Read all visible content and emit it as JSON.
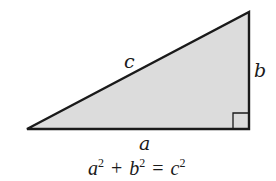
{
  "diagram": {
    "colors": {
      "fill": "#dcdcdc",
      "stroke": "#1a1a1a",
      "background": "#ffffff"
    },
    "vertices": {
      "left": [
        27,
        129
      ],
      "right_bottom": [
        249,
        129
      ],
      "right_top": [
        249,
        12
      ]
    },
    "right_angle_marker": {
      "x": 233,
      "y": 113,
      "size": 16
    },
    "labels": {
      "hypotenuse": "c",
      "vertical_leg": "b",
      "horizontal_leg": "a"
    },
    "equation": {
      "a": "a",
      "a_exp": "2",
      "plus": "+",
      "b": "b",
      "b_exp": "2",
      "equals": "=",
      "c": "c",
      "c_exp": "2"
    }
  }
}
